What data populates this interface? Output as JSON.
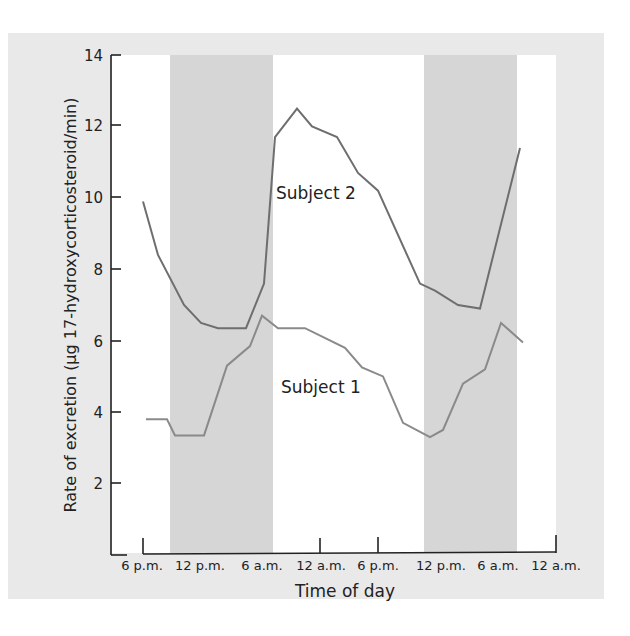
{
  "chart_data": {
    "type": "line",
    "title": "",
    "xlabel": "Time of day",
    "ylabel": "Rate of excretion (µg 17-hydroxycorticosteroid/min)",
    "ylim": [
      0,
      14
    ],
    "yticks": [
      2,
      4,
      6,
      8,
      10,
      12,
      14
    ],
    "xtick_labels": [
      "6 p.m.",
      "12 p.m.",
      "6 a.m.",
      "12 a.m.",
      "6 p.m.",
      "12 p.m.",
      "6 a.m.",
      "12 a.m."
    ],
    "grid": false,
    "legend": "inline labels",
    "shaded_bands": [
      {
        "label": "night",
        "from_px": 170,
        "to_px": 273
      },
      {
        "label": "night",
        "from_px": 424,
        "to_px": 517
      }
    ],
    "series": [
      {
        "name": "Subject 2",
        "color": "#6e6e6e",
        "points": [
          {
            "x": 143,
            "y": 9.9
          },
          {
            "x": 158,
            "y": 8.4
          },
          {
            "x": 184,
            "y": 7.0
          },
          {
            "x": 201,
            "y": 6.5
          },
          {
            "x": 218,
            "y": 6.35
          },
          {
            "x": 246,
            "y": 6.35
          },
          {
            "x": 264,
            "y": 7.6
          },
          {
            "x": 275,
            "y": 11.7
          },
          {
            "x": 297,
            "y": 12.5
          },
          {
            "x": 312,
            "y": 12.0
          },
          {
            "x": 337,
            "y": 11.7
          },
          {
            "x": 358,
            "y": 10.7
          },
          {
            "x": 378,
            "y": 10.2
          },
          {
            "x": 420,
            "y": 7.6
          },
          {
            "x": 435,
            "y": 7.4
          },
          {
            "x": 458,
            "y": 7.0
          },
          {
            "x": 480,
            "y": 6.9
          },
          {
            "x": 520,
            "y": 11.4
          }
        ]
      },
      {
        "name": "Subject 1",
        "color": "#8a8a8a",
        "points": [
          {
            "x": 146,
            "y": 3.8
          },
          {
            "x": 167,
            "y": 3.8
          },
          {
            "x": 175,
            "y": 3.35
          },
          {
            "x": 204,
            "y": 3.35
          },
          {
            "x": 227,
            "y": 5.3
          },
          {
            "x": 250,
            "y": 5.85
          },
          {
            "x": 262,
            "y": 6.7
          },
          {
            "x": 278,
            "y": 6.35
          },
          {
            "x": 305,
            "y": 6.35
          },
          {
            "x": 345,
            "y": 5.8
          },
          {
            "x": 362,
            "y": 5.25
          },
          {
            "x": 383,
            "y": 5.0
          },
          {
            "x": 403,
            "y": 3.7
          },
          {
            "x": 430,
            "y": 3.3
          },
          {
            "x": 443,
            "y": 3.5
          },
          {
            "x": 463,
            "y": 4.8
          },
          {
            "x": 485,
            "y": 5.2
          },
          {
            "x": 501,
            "y": 6.5
          },
          {
            "x": 523,
            "y": 5.95
          }
        ]
      }
    ]
  },
  "labels": {
    "xlabel": "Time of day",
    "ylabel": "Rate of excretion (µg 17-hydroxycorticosteroid/min)",
    "subject2": "Subject 2",
    "subject1": "Subject 1",
    "y14": "14",
    "y12": "12",
    "y10": "10",
    "y8": "8",
    "y6": "6",
    "y4": "4",
    "y2": "2",
    "x0": "6 p.m.",
    "x1": "12 p.m.",
    "x2": "6 a.m.",
    "x3": "12 a.m.",
    "x4": "6 p.m.",
    "x5": "12 p.m.",
    "x6": "6 a.m.",
    "x7": "12 a.m."
  },
  "colors": {
    "panel": "#e9e9e9",
    "band": "#d6d6d6",
    "plot_bg": "#ffffff",
    "axis": "#222222"
  }
}
